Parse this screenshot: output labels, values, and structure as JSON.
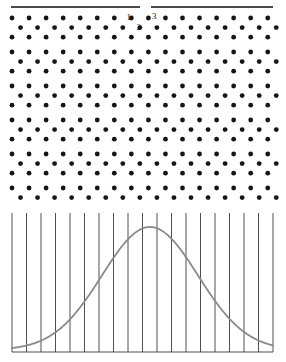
{
  "figure": {
    "canvas": {
      "width": 286,
      "height": 362,
      "background": "#ffffff"
    },
    "rule": {
      "name": "top-divider-rule",
      "color": "#4a4a4a",
      "thickness": 2,
      "y": 7,
      "segments": [
        {
          "x1": 11,
          "x2": 140
        },
        {
          "x1": 151,
          "x2": 273
        }
      ]
    },
    "dot_field": {
      "name": "hexagonal-dot-lattice",
      "dot_color": "#161616",
      "dot_radius": 2.4,
      "x_start": 12,
      "x_spacing": 17.05,
      "columns": 17,
      "offset_x": 8.5,
      "y_start": 18,
      "row_spacing": 9.6,
      "group_gap": 5.2,
      "groups": 6,
      "rows_per_group": 3,
      "offset_row_index": 1
    },
    "point_labels": [
      {
        "id": "label-1",
        "text": "1",
        "x": 131,
        "y": 20,
        "anchor": "end"
      },
      {
        "id": "label-2",
        "text": "2",
        "x": 141,
        "y": 30,
        "anchor": "end"
      },
      {
        "id": "label-3",
        "text": "3",
        "x": 152,
        "y": 19,
        "anchor": "start"
      }
    ]
  },
  "chart_data": {
    "type": "line",
    "title": "",
    "subtitle": "",
    "xlabel": "",
    "ylabel": "",
    "grid": true,
    "grid_orientation": "vertical",
    "legend": "none",
    "curve_color": "#8a8a8a",
    "curve_width": 1.8,
    "gridline_color": "#3d3d3d",
    "gridline_width": 0.9,
    "baseline_color": "#3d3d3d",
    "plot_box": {
      "left": 12,
      "right": 273,
      "top": 213,
      "bottom": 352
    },
    "xlim": [
      0,
      19
    ],
    "ylim": [
      0,
      1
    ],
    "gridline_count": 19,
    "gridline_x_positions": [
      12.0,
      26.5,
      41.0,
      55.5,
      70.0,
      84.5,
      99.0,
      113.5,
      128.0,
      142.5,
      157.0,
      171.5,
      186.0,
      200.5,
      215.0,
      229.5,
      244.0,
      258.5,
      273.0
    ],
    "distribution": "gaussian",
    "peak_x": 150,
    "peak_y_value": 1.0,
    "sigma_px": 48,
    "x": [
      12,
      26.5,
      41,
      55.5,
      70,
      84.5,
      99,
      113.5,
      128,
      142.5,
      157,
      171.5,
      186,
      200.5,
      215,
      229.5,
      244,
      258.5,
      273
    ],
    "values": [
      0.01,
      0.02,
      0.04,
      0.08,
      0.15,
      0.27,
      0.43,
      0.63,
      0.84,
      0.99,
      0.99,
      0.88,
      0.68,
      0.47,
      0.29,
      0.15,
      0.07,
      0.03,
      0.01
    ]
  }
}
